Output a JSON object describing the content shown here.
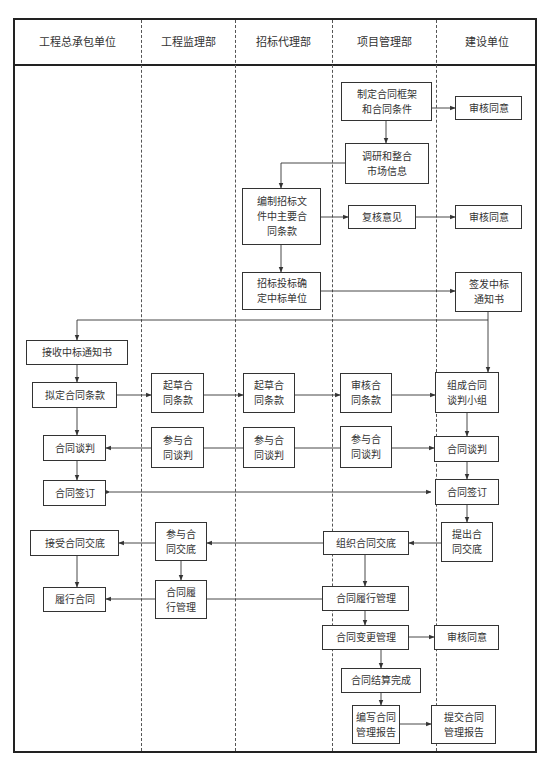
{
  "lanes": [
    {
      "id": "lane1",
      "title": "工程总承包单位"
    },
    {
      "id": "lane2",
      "title": "工程监理部"
    },
    {
      "id": "lane3",
      "title": "招标代理部"
    },
    {
      "id": "lane4",
      "title": "项目管理部"
    },
    {
      "id": "lane5",
      "title": "建设单位"
    }
  ],
  "nodes": {
    "n_framework": "制定合同框架\n和合同条件",
    "n_approve1": "审核同意",
    "n_research": "调研和整合\n市场信息",
    "n_bid_docs": "编制招标文\n件中主要合\n同条款",
    "n_review": "复核意见",
    "n_approve2": "审核同意",
    "n_bidding": "招标投标确\n定中标单位",
    "n_issue_notice": "签发中标\n通知书",
    "n_receive_notice": "接收中标通知书",
    "n_draft_terms": "拟定合同条款",
    "n_draft_l2": "起草合\n同条款",
    "n_draft_l3": "起草合\n同条款",
    "n_audit_terms": "审核合\n同条款",
    "n_team": "组成合同\n谈判小组",
    "n_nego_l1": "合同谈判",
    "n_join_nego_l2": "参与合\n同谈判",
    "n_join_nego_l3": "参与合\n同谈判",
    "n_join_nego_l4": "参与合\n同谈判",
    "n_nego_l5": "合同谈判",
    "n_sign_l1": "合同签订",
    "n_sign_l5": "合同签订",
    "n_propose_brief": "提出合\n同交底",
    "n_org_brief": "组织合同交底",
    "n_join_brief": "参与合\n同交底",
    "n_accept_brief": "接受合同交底",
    "n_perform": "履行合同",
    "n_perf_mgmt_l2": "合同履\n行管理",
    "n_perf_mgmt_l4": "合同履行管理",
    "n_change_mgmt": "合同变更管理",
    "n_approve3": "审核同意",
    "n_settle": "合同结算完成",
    "n_write_report": "编写合同\n管理报告",
    "n_submit_report": "提交合同\n管理报告"
  },
  "colors": {
    "line": "#333333",
    "frame": "#222222",
    "background": "#ffffff"
  }
}
